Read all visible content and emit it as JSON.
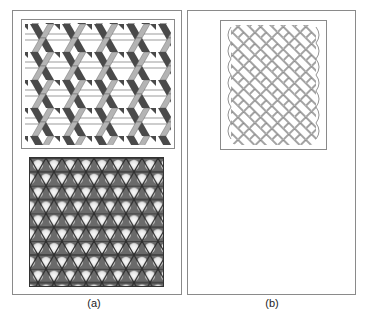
{
  "figure": {
    "panels": [
      {
        "id": "a",
        "caption": "(a)",
        "subfigures": [
          {
            "name": "3d-woven-ribbon-pattern",
            "description": "Triaxial weave of shaded ribbons (white, light gray, dark gray)"
          },
          {
            "name": "kagome-lattice-pattern",
            "description": "Dense triaxial kagome weave with light hexagonal openings"
          }
        ]
      },
      {
        "id": "b",
        "caption": "(b)",
        "subfigures": [
          {
            "name": "basket-weave-outline-pattern",
            "description": "Diagonal basket weave drawn in outline"
          }
        ]
      }
    ],
    "colors": {
      "border": "#8a8a8a",
      "ribbon_white": "#ffffff",
      "ribbon_light": "#b4b4b4",
      "ribbon_dark": "#4a4a4a",
      "kagome_line": "#3a3a3a",
      "kagome_hole": "#eeeeee",
      "weave_line": "#666666"
    }
  }
}
